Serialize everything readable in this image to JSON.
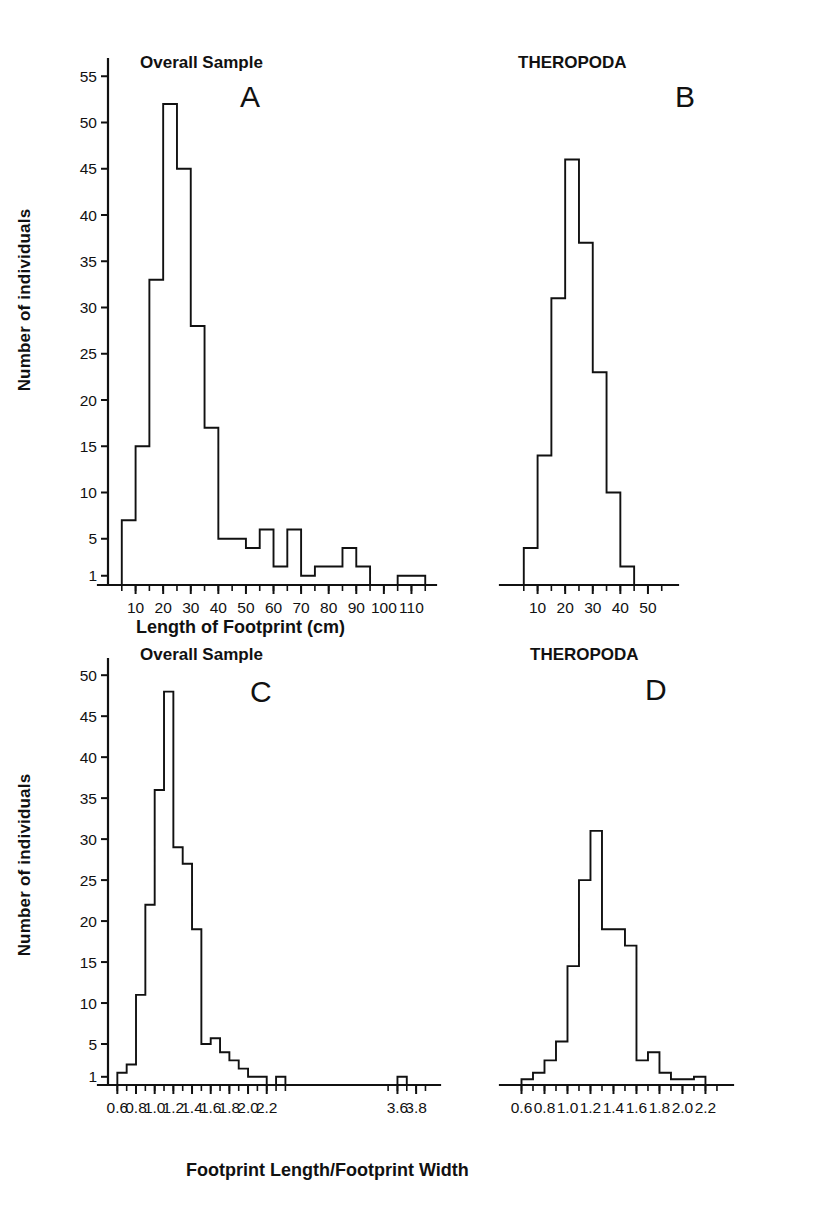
{
  "figure": {
    "yaxis_title": "Number of individuals",
    "xaxis_title_top": "Length of Footprint (cm)",
    "xaxis_title_bottom": "Footprint Length/Footprint Width"
  },
  "panels": {
    "A": {
      "letter": "A",
      "title": "Overall Sample"
    },
    "B": {
      "letter": "B",
      "title": "THEROPODA"
    },
    "C": {
      "letter": "C",
      "title": "Overall Sample"
    },
    "D": {
      "letter": "D",
      "title": "THEROPODA"
    }
  },
  "chart_data": [
    {
      "type": "bar",
      "panel": "A",
      "title": "Overall Sample",
      "xlabel": "Length of Footprint (cm)",
      "ylabel": "Number of individuals",
      "bin_width": 5,
      "xlim": [
        0,
        115
      ],
      "ylim": [
        0,
        55
      ],
      "xticks": [
        10,
        20,
        30,
        40,
        50,
        60,
        70,
        80,
        90,
        100,
        110
      ],
      "yticks": [
        1,
        5,
        10,
        15,
        20,
        25,
        30,
        35,
        40,
        45,
        50,
        55
      ],
      "grid": false,
      "bin_starts": [
        5,
        10,
        15,
        20,
        25,
        30,
        35,
        40,
        45,
        50,
        55,
        60,
        65,
        70,
        75,
        80,
        85,
        90,
        95,
        100,
        105,
        110
      ],
      "values": [
        7,
        15,
        33,
        52,
        45,
        28,
        17,
        5,
        5,
        4,
        6,
        2,
        6,
        1,
        2,
        2,
        4,
        2,
        0,
        0,
        1,
        1
      ]
    },
    {
      "type": "bar",
      "panel": "B",
      "title": "THEROPODA",
      "xlabel": "Length of Footprint (cm)",
      "ylabel": "Number of individuals",
      "bin_width": 5,
      "xlim": [
        0,
        55
      ],
      "ylim": [
        0,
        55
      ],
      "xticks": [
        10,
        20,
        30,
        40,
        50
      ],
      "grid": false,
      "bin_starts": [
        5,
        10,
        15,
        20,
        25,
        30,
        35,
        40
      ],
      "values": [
        4,
        14,
        31,
        46,
        37,
        23,
        10,
        2
      ]
    },
    {
      "type": "bar",
      "panel": "C",
      "title": "Overall Sample",
      "xlabel": "Footprint Length/Footprint Width",
      "ylabel": "Number of individuals",
      "bin_width": 0.1,
      "xlim": [
        0.5,
        3.95
      ],
      "ylim": [
        0,
        50
      ],
      "xticks": [
        0.6,
        0.8,
        1.0,
        1.2,
        1.4,
        1.6,
        1.8,
        2.0,
        2.2,
        3.6,
        3.8
      ],
      "yticks": [
        1,
        5,
        10,
        15,
        20,
        25,
        30,
        35,
        40,
        45,
        50
      ],
      "axis_break": {
        "from": 2.35,
        "to": 3.45,
        "style": "dotted"
      },
      "grid": false,
      "bin_starts": [
        0.6,
        0.7,
        0.8,
        0.9,
        1.0,
        1.1,
        1.2,
        1.3,
        1.4,
        1.5,
        1.6,
        1.7,
        1.8,
        1.9,
        2.0,
        2.1,
        2.3,
        3.6
      ],
      "values": [
        1.5,
        2.5,
        11,
        22,
        36,
        48,
        29,
        27,
        19,
        5,
        5.7,
        4,
        3,
        2,
        1,
        1,
        1,
        1
      ]
    },
    {
      "type": "bar",
      "panel": "D",
      "title": "THEROPODA",
      "xlabel": "Footprint Length/Footprint Width",
      "ylabel": "Number of individuals",
      "bin_width": 0.1,
      "xlim": [
        0.5,
        2.35
      ],
      "ylim": [
        0,
        50
      ],
      "xticks": [
        0.6,
        0.8,
        1.0,
        1.2,
        1.4,
        1.6,
        1.8,
        2.0,
        2.2
      ],
      "grid": false,
      "bin_starts": [
        0.6,
        0.7,
        0.8,
        0.9,
        1.0,
        1.1,
        1.2,
        1.3,
        1.4,
        1.5,
        1.6,
        1.7,
        1.8,
        1.9,
        2.0,
        2.1
      ],
      "values": [
        0.7,
        1.5,
        3,
        5.3,
        14.5,
        25,
        31,
        19,
        19,
        17,
        3,
        4,
        1.5,
        0.7,
        0.7,
        1
      ]
    }
  ]
}
